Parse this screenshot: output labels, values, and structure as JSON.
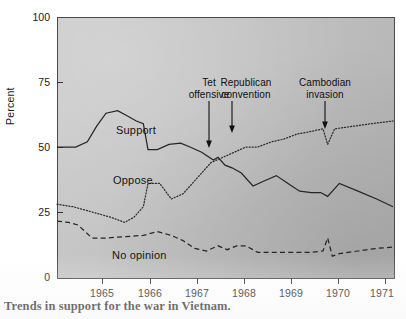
{
  "caption": "Trends in support for the war in Vietnam.",
  "axes": {
    "ylabel": "Percent",
    "yticks": [
      "0",
      "25",
      "50",
      "75",
      "100"
    ],
    "xticks": [
      "1965",
      "1966",
      "1967",
      "1968",
      "1969",
      "1970",
      "1971"
    ]
  },
  "series_labels": {
    "support": "Support",
    "oppose": "Oppose",
    "no_opinion": "No opinion"
  },
  "annotations": [
    {
      "line1": "Tet",
      "line2": "offensive"
    },
    {
      "line1": "Republican",
      "line2": "convention"
    },
    {
      "line1": "Cambodian",
      "line2": "invasion"
    }
  ],
  "chart_data": {
    "type": "line",
    "title": "Trends in support for the war in Vietnam.",
    "xlabel": "",
    "ylabel": "Percent",
    "xlim": [
      1964.15,
      1971.35
    ],
    "ylim": [
      0,
      100
    ],
    "grid": false,
    "legend": "inline-labels",
    "annotations": [
      {
        "label": "Tet offensive",
        "x": 1967.55,
        "y": 44
      },
      {
        "label": "Republican convention",
        "x": 1968.0,
        "y": 48
      },
      {
        "label": "Cambodian invasion",
        "x": 1970.0,
        "y": 56
      }
    ],
    "series": [
      {
        "name": "Support",
        "style": "solid",
        "x": [
          1964.15,
          1964.55,
          1964.8,
          1965.0,
          1965.2,
          1965.45,
          1965.65,
          1965.85,
          1966.0,
          1966.1,
          1966.3,
          1966.55,
          1966.8,
          1967.0,
          1967.25,
          1967.5,
          1967.6,
          1967.75,
          1967.9,
          1968.1,
          1968.35,
          1968.6,
          1968.85,
          1969.1,
          1969.35,
          1969.6,
          1969.8,
          1969.95,
          1970.2,
          1970.6,
          1971.0,
          1971.35
        ],
        "y": [
          50,
          50,
          52,
          58,
          63,
          64,
          62,
          60,
          59,
          49,
          49,
          51,
          51.5,
          50,
          48,
          45,
          46,
          43,
          42,
          40,
          35,
          37,
          39,
          36,
          33,
          32.5,
          32.5,
          31,
          36,
          33,
          30,
          27
        ]
      },
      {
        "name": "Oppose",
        "style": "dotted",
        "x": [
          1964.15,
          1964.5,
          1964.9,
          1965.3,
          1965.6,
          1965.8,
          1966.0,
          1966.1,
          1966.35,
          1966.6,
          1966.85,
          1967.15,
          1967.45,
          1967.7,
          1967.95,
          1968.2,
          1968.45,
          1968.75,
          1969.0,
          1969.3,
          1969.6,
          1969.85,
          1969.95,
          1970.1,
          1970.5,
          1970.9,
          1971.35
        ],
        "y": [
          28,
          27,
          25,
          23,
          21,
          23,
          27,
          36,
          36,
          30,
          32,
          38,
          44,
          46,
          48,
          50,
          50,
          52,
          53,
          55,
          56,
          57,
          51,
          57,
          58,
          59,
          60
        ]
      },
      {
        "name": "No opinion",
        "style": "dashed",
        "x": [
          1964.15,
          1964.4,
          1964.6,
          1964.9,
          1965.2,
          1965.6,
          1966.0,
          1966.3,
          1966.6,
          1966.85,
          1967.1,
          1967.35,
          1967.6,
          1967.8,
          1968.0,
          1968.2,
          1968.45,
          1968.8,
          1969.2,
          1969.6,
          1969.85,
          1969.95,
          1970.05,
          1970.2,
          1970.6,
          1971.0,
          1971.35
        ],
        "y": [
          21.5,
          21,
          20,
          15,
          15,
          15.5,
          16,
          17.5,
          16,
          14,
          11,
          10,
          12,
          10.5,
          12,
          12,
          9.5,
          9.5,
          9.5,
          9.5,
          10,
          15,
          8,
          9,
          10,
          11,
          11.5
        ]
      }
    ]
  }
}
